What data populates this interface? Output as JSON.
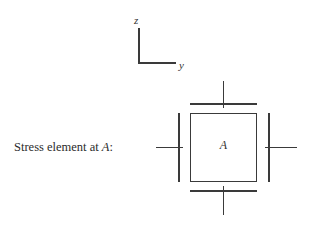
{
  "figure": {
    "background_color": "#ffffff",
    "line_color": "#3a3a3a",
    "text_color": "#333333"
  },
  "axis_indicator": {
    "vertical_label": "z",
    "horizontal_label": "y"
  },
  "caption": {
    "text_before": "Stress element at ",
    "point_label": "A",
    "text_after": ":"
  },
  "stress_element": {
    "center_label": "A",
    "faces": [
      {
        "name": "top",
        "label": ""
      },
      {
        "name": "bottom",
        "label": ""
      },
      {
        "name": "left",
        "label": ""
      },
      {
        "name": "right",
        "label": ""
      }
    ]
  }
}
